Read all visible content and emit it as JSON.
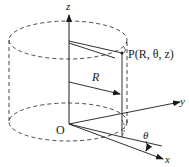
{
  "diagram": {
    "type": "cylindrical-coordinates",
    "labels": {
      "z_axis": "z",
      "y_axis": "y",
      "x_axis": "x",
      "origin": "O",
      "point": "P(R, θ, z)",
      "radius": "R",
      "angle": "θ"
    },
    "colors": {
      "line": "#1a1a1a",
      "background": "#ffffff"
    }
  }
}
